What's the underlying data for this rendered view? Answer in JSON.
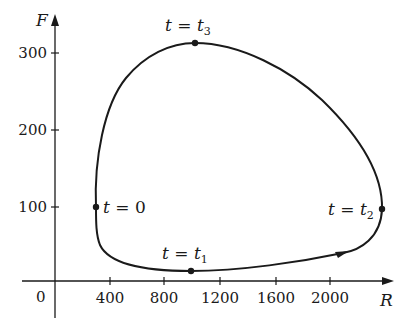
{
  "diagram": {
    "type": "parametric phase-plane curve",
    "axes": {
      "x": {
        "label": "R",
        "origin_label": "0",
        "ticks": [
          "400",
          "800",
          "1200",
          "1600",
          "2000"
        ]
      },
      "y": {
        "label": "F",
        "ticks": [
          "100",
          "200",
          "300"
        ]
      }
    },
    "points": [
      {
        "id": "t0",
        "lhs": "t",
        "eq": " = ",
        "rhs": "0",
        "sub": "",
        "R": 300,
        "F": 100
      },
      {
        "id": "t1",
        "lhs": "t",
        "eq": " = ",
        "rhs": "t",
        "sub": "1",
        "R": 1000,
        "F": 12
      },
      {
        "id": "t2",
        "lhs": "t",
        "eq": " = ",
        "rhs": "t",
        "sub": "2",
        "R": 2350,
        "F": 98
      },
      {
        "id": "t3",
        "lhs": "t",
        "eq": " = ",
        "rhs": "t",
        "sub": "3",
        "R": 1000,
        "F": 313
      }
    ],
    "direction": "counterclockwise",
    "colors": {
      "curve": "#1a1a1a",
      "background": "#ffffff"
    }
  }
}
